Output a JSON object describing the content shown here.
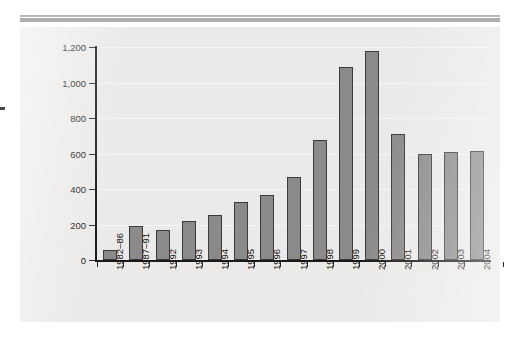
{
  "chart_data": {
    "type": "bar",
    "title": "",
    "subtitle": "",
    "xlabel": "",
    "ylabel": "",
    "categories": [
      "1982–86",
      "1987–91",
      "1992",
      "1993",
      "1994",
      "1995",
      "1996",
      "1997",
      "1998",
      "1999",
      "2000",
      "2001",
      "2002",
      "2003",
      "2004"
    ],
    "values": [
      56,
      192,
      169,
      222,
      253,
      327,
      366,
      468,
      676,
      1085,
      1180,
      710,
      597,
      608,
      614
    ],
    "ytick_labels": [
      "0",
      "200",
      "400",
      "600",
      "800",
      "1,000",
      "1,200"
    ],
    "ytick_values": [
      0,
      200,
      400,
      600,
      800,
      1000,
      1200
    ],
    "ylim": [
      0,
      1200
    ],
    "grid": "horizontal",
    "legend": "none",
    "bar_color": "#8a8a8a",
    "bar_outline_color": "#3a3a3a",
    "axis_color": "#1a1a1a",
    "panel_color": "#ebeae8",
    "gridline_color": "#f7f6f5",
    "x_tick_label_rotation": -90
  },
  "figure": {
    "background_color": "#ffffff",
    "top_rule_color": "#aeaeae",
    "edge_mark_color": "#4a4a4a"
  }
}
